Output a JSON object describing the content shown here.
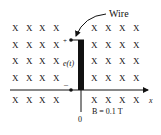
{
  "labels": {
    "wire": "Wire",
    "emf": "e(t)",
    "plus": "+",
    "minus": "–",
    "x_axis": "x",
    "origin": "0",
    "field": "B = 0.1 T"
  },
  "field_marker": "X",
  "grid": {
    "left_cols": [
      12,
      26,
      39,
      53
    ],
    "right_cols": [
      91,
      105,
      119,
      133
    ],
    "rows": [
      24,
      41,
      57,
      74,
      96
    ]
  }
}
